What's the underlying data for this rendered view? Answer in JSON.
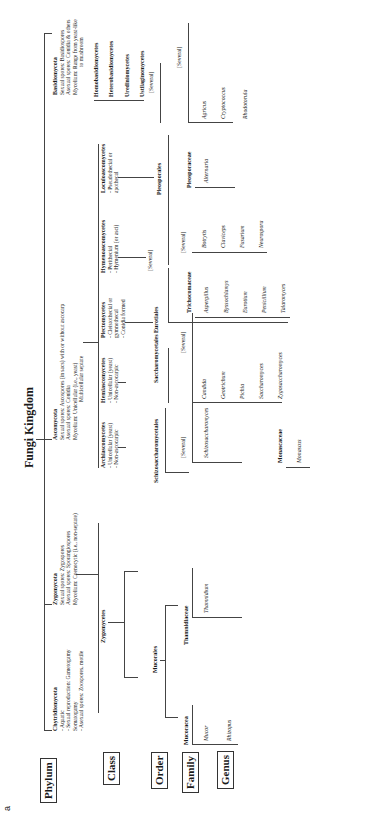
{
  "title": "Fungi Kingdom",
  "figure_label": "a",
  "ranks": [
    "Phylum",
    "Class",
    "Order",
    "Family",
    "Genus"
  ],
  "phyla": [
    {
      "name": "Chytridiomycota",
      "notes": [
        "- Aquatic",
        "- Sexual reproduction: Gametogamy",
        "  Somatogamy",
        "- Asexual spores: Zoospores, motile"
      ]
    },
    {
      "name": "Zygomycota",
      "notes": [
        "Sexual spores: Zygospores",
        "Asexual spores: Sporangiospores",
        "Mycelium: Coenocytic (i.e., non-septate)"
      ]
    },
    {
      "name": "Ascomycota",
      "notes": [
        "Sexual spores: Ascospores (in sacs) with or without ascocarp",
        "Asexual spores: Conidia",
        "Mycelium: Unicellular (i.e., yeast)",
        "Multicellular septate"
      ]
    },
    {
      "name": "Basidiomycota",
      "notes": [
        "Sexual spores: Basidiospores",
        "Asexual spores: Conidia & others",
        "Mycelium: Range from yeast-like",
        "to mushroom"
      ]
    }
  ],
  "classes": {
    "zygomycetes": "Zygomycetes",
    "archiascomycetes": {
      "name": "Archiascomycetes",
      "notes": [
        "- Unicellular (yeast)",
        "- Non-ascocarpic"
      ]
    },
    "hemiascomycetes": {
      "name": "Hemiascomycetes",
      "notes": [
        "- Unicellular (yeast)",
        "- Non-ascocarpic"
      ]
    },
    "plectomycetes": {
      "name": "Plectomycetes",
      "notes": [
        "- Cleistothecial or",
        "  gymnothecal",
        "- Conidia formed"
      ]
    },
    "hymenoascomycetes": {
      "name": "Hymenoascomycetes",
      "notes": [
        "- Perithecial",
        "- Hymenium (or asci)"
      ]
    },
    "loculoascomycetes": {
      "name": "Loculoascomycetes",
      "notes": [
        "- Pseudothecial or",
        "  apothecal"
      ]
    },
    "basidio": [
      "Homobasidiomycetes",
      "Heterobasidiomycetes",
      "Urediniomycetes",
      "Ustilaginomycetes"
    ]
  },
  "orders": {
    "mucorales": "Mucorales",
    "schizo": "Schizosaccharomycetales",
    "sacch": "Saccharomycetales",
    "eurotiales": "Eurotiales",
    "hymeno_several": "[Several]",
    "pleosporales": "Pleosporales",
    "basidio_several": "[Several]"
  },
  "families": {
    "mucoraceae": "Mucoracea",
    "thamnidiaceae": "Thamnidiaceae",
    "schizo_several": "[Several]",
    "sacch_several": "[Several]",
    "trichocomaceae": "Trichocomaceae",
    "monascaceae": "Monascaceae",
    "hymeno_several": "[Several]",
    "pleosporaceae": "Pleosporaceae",
    "basidio_several": "[Several]"
  },
  "genera": {
    "mucoraceae": [
      "Mucor",
      "Rhizopus"
    ],
    "thamnidiaceae": [
      "Thamnidium"
    ],
    "schizo": [
      "Schizosaccharomyces"
    ],
    "sacch": [
      "Candida",
      "Geotrichum",
      "Pichia",
      "Saccharomyces",
      "Zygosaccharomyces"
    ],
    "trichocomaceae": [
      "Aspergillus",
      "Byssochlamys",
      "Eurotium",
      "Penicillium",
      "Talaromyces"
    ],
    "monascaceae": [
      "Monascus"
    ],
    "hymeno": [
      "Botrytis",
      "Claviceps",
      "Fusarium",
      "Neurospora"
    ],
    "pleosporaceae": [
      "Alternaria"
    ],
    "basidio": [
      "Agricus",
      "Cryptococcus",
      "Rhodotorula"
    ]
  }
}
